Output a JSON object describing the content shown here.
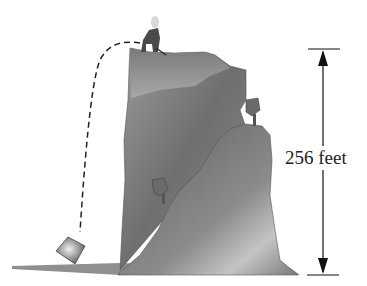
{
  "figure": {
    "height_label": "256 feet",
    "elements": [
      "cliff",
      "person-on-cliff-top",
      "dashed-trajectory",
      "falling-rock",
      "ground",
      "trees",
      "height-dimension-arrow"
    ]
  }
}
